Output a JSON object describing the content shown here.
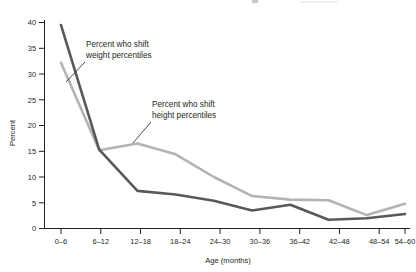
{
  "chart_data": {
    "type": "line",
    "title": "",
    "xlabel": "Age (months)",
    "ylabel": "Percent",
    "categories": [
      "0–6",
      "6–12",
      "12–18",
      "18–24",
      "24–30",
      "30–36",
      "36–42",
      "42–48",
      "48–54",
      "54–60"
    ],
    "ylim": [
      0,
      40
    ],
    "yticks": [
      0,
      5,
      10,
      15,
      20,
      25,
      30,
      35,
      40
    ],
    "ytick_labels": [
      "0",
      "5",
      "10",
      "15",
      "20",
      "25",
      "30",
      "35",
      "40"
    ],
    "grid": false,
    "legend_position": "inline-annotations",
    "series": [
      {
        "name": "Percent who shift weight percentiles",
        "color": "#595959",
        "values": [
          39.5,
          15.3,
          7.3,
          6.6,
          5.4,
          3.5,
          4.6,
          1.7,
          2.0,
          2.8
        ]
      },
      {
        "name": "Percent who shift height percentiles",
        "color": "#b3b3b3",
        "values": [
          32.2,
          15.2,
          16.5,
          14.4,
          10.0,
          6.3,
          5.6,
          5.5,
          2.6,
          4.8
        ]
      }
    ],
    "annotations": [
      {
        "id": "weight-annotation",
        "line1": "Percent who shift",
        "line2": "weight percentiles",
        "target_series": "Percent who shift weight percentiles"
      },
      {
        "id": "height-annotation",
        "line1": "Percent who shift",
        "line2": "height percentiles",
        "target_series": "Percent who shift height percentiles"
      }
    ]
  },
  "axes": {
    "y_axis_label": "Percent",
    "x_axis_label": "Age (months)"
  }
}
